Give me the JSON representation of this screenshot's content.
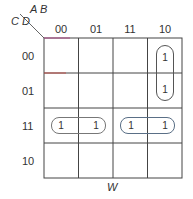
{
  "kmap": {
    "var_label_top": "A B",
    "var_label_side": "C D",
    "columns": [
      "00",
      "01",
      "11",
      "10"
    ],
    "rows": [
      "00",
      "01",
      "11",
      "10"
    ],
    "cells": [
      [
        "",
        "",
        "",
        "1"
      ],
      [
        "",
        "",
        "",
        "1"
      ],
      [
        "1",
        "1",
        "1",
        "1"
      ],
      [
        "",
        "",
        "",
        ""
      ]
    ],
    "groups": [
      {
        "cells": [
          [
            0,
            3
          ],
          [
            1,
            3
          ]
        ],
        "orientation": "vertical"
      },
      {
        "cells": [
          [
            2,
            0
          ],
          [
            2,
            1
          ]
        ],
        "orientation": "horizontal"
      },
      {
        "cells": [
          [
            2,
            2
          ],
          [
            2,
            3
          ]
        ],
        "orientation": "horizontal",
        "color": "#5a6f86"
      }
    ],
    "bottom_label": "W",
    "one": "1"
  }
}
